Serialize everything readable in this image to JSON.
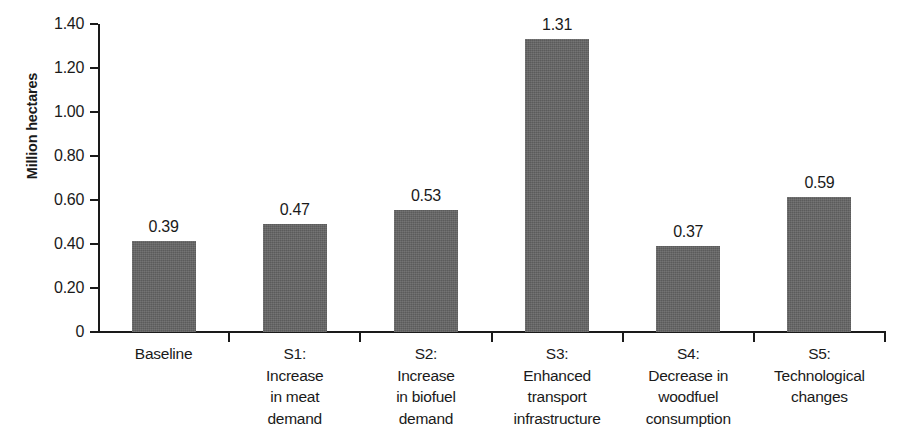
{
  "chart_data": {
    "type": "bar",
    "title": "",
    "xlabel": "",
    "ylabel": "Million hectares",
    "ylim": [
      0,
      1.4
    ],
    "grid": false,
    "legend": null,
    "categories": [
      "Baseline",
      "S1: Increase in meat demand",
      "S2: Increase in biofuel demand",
      "S3: Enhanced transport infrastructure",
      "S4: Decrease in woodfuel consumption",
      "S5: Technological changes"
    ],
    "values": [
      0.39,
      0.47,
      0.53,
      1.31,
      0.37,
      0.59
    ],
    "bar_color": "#646464",
    "y_ticks": [
      "0",
      "0.20",
      "0.40",
      "0.60",
      "0.80",
      "1.00",
      "1.20",
      "1.40"
    ],
    "y_tick_values": [
      0,
      0.2,
      0.4,
      0.6,
      0.8,
      1.0,
      1.2,
      1.4
    ],
    "data_labels": [
      "0.39",
      "0.47",
      "0.53",
      "1.31",
      "0.37",
      "0.59"
    ]
  },
  "axis": {
    "y_title": "Million hectares"
  },
  "x_category_lines": [
    [
      "Baseline"
    ],
    [
      "S1:",
      "Increase",
      "in meat",
      "demand"
    ],
    [
      "S2:",
      "Increase",
      "in biofuel",
      "demand"
    ],
    [
      "S3:",
      "Enhanced",
      "transport",
      "infrastructure"
    ],
    [
      "S4:",
      "Decrease in",
      "woodfuel",
      "consumption"
    ],
    [
      "S5:",
      "Technological",
      "changes"
    ]
  ]
}
